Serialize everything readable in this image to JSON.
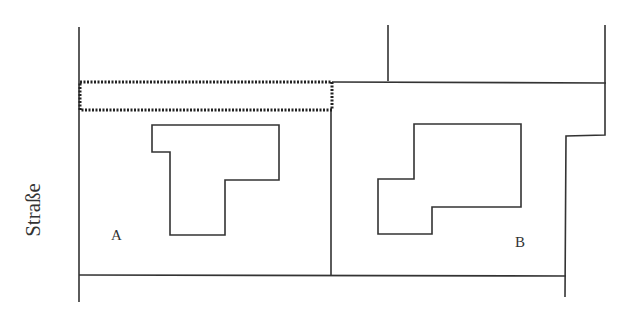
{
  "diagram": {
    "type": "site-plan",
    "street_label": "Straße",
    "plots": [
      {
        "id": "A",
        "label": "A"
      },
      {
        "id": "B",
        "label": "B"
      }
    ],
    "highlighted_strip": "dotted rectangle along top of plot A",
    "colors": {
      "line": "#333333",
      "background": "#ffffff"
    }
  }
}
